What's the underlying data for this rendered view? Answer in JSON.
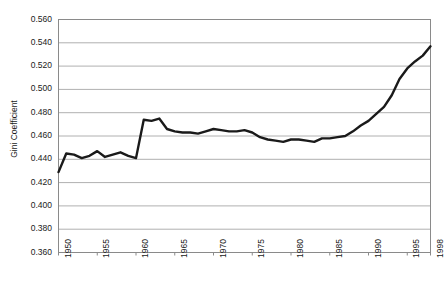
{
  "chart_data": {
    "type": "line",
    "title": "",
    "subtitle": "",
    "xlabel": "",
    "ylabel": "Gini Coefficient",
    "xlim": [
      1950,
      1998
    ],
    "ylim": [
      0.36,
      0.56
    ],
    "grid": "horizontal",
    "legend": "none",
    "line_color": "#1a1a1a",
    "grid_color": "#b0b0b0",
    "border_color": "#8a8a8a",
    "background_color": "#ffffff",
    "ytick_labels": [
      "0.560",
      "0.540",
      "0.520",
      "0.500",
      "0.480",
      "0.460",
      "0.440",
      "0.420",
      "0.400",
      "0.380",
      "0.360"
    ],
    "ytick_values": [
      0.56,
      0.54,
      0.52,
      0.5,
      0.48,
      0.46,
      0.44,
      0.42,
      0.4,
      0.38,
      0.36
    ],
    "xtick_labels": [
      "1950",
      "1955",
      "1960",
      "1965",
      "1970",
      "1975",
      "1980",
      "1985",
      "1990",
      "1995",
      "1998"
    ],
    "xtick_values": [
      1950,
      1955,
      1960,
      1965,
      1970,
      1975,
      1980,
      1985,
      1990,
      1995,
      1998
    ],
    "x": [
      1950,
      1951,
      1952,
      1953,
      1954,
      1955,
      1956,
      1957,
      1958,
      1959,
      1960,
      1961,
      1962,
      1963,
      1964,
      1965,
      1966,
      1967,
      1968,
      1969,
      1970,
      1971,
      1972,
      1973,
      1974,
      1975,
      1976,
      1977,
      1978,
      1979,
      1980,
      1981,
      1982,
      1983,
      1984,
      1985,
      1986,
      1987,
      1988,
      1989,
      1990,
      1991,
      1992,
      1993,
      1994,
      1995,
      1996,
      1997,
      1998
    ],
    "values": [
      0.429,
      0.445,
      0.444,
      0.441,
      0.443,
      0.447,
      0.442,
      0.444,
      0.446,
      0.443,
      0.441,
      0.474,
      0.473,
      0.475,
      0.466,
      0.464,
      0.463,
      0.463,
      0.462,
      0.464,
      0.466,
      0.465,
      0.464,
      0.464,
      0.465,
      0.463,
      0.459,
      0.457,
      0.456,
      0.455,
      0.457,
      0.457,
      0.456,
      0.455,
      0.458,
      0.458,
      0.459,
      0.46,
      0.464,
      0.469,
      0.473,
      0.479,
      0.485,
      0.495,
      0.509,
      0.518,
      0.524,
      0.529,
      0.537
    ],
    "series_name": "Gini Coefficient"
  }
}
